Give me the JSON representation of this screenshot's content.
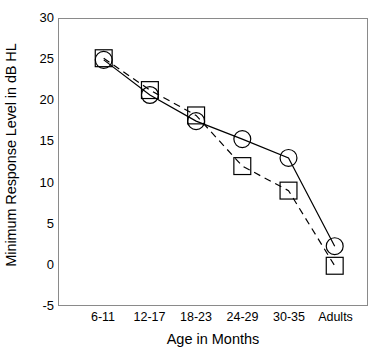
{
  "chart_data": {
    "type": "line",
    "title": "",
    "xlabel": "Age in Months",
    "ylabel": "Minimum Response Level in dB HL",
    "categories": [
      "6-11",
      "12-17",
      "18-23",
      "24-29",
      "30-35",
      "Adults"
    ],
    "yticks": [
      30,
      25,
      20,
      15,
      10,
      5,
      0,
      -5
    ],
    "ytick_labels": [
      "30",
      "25",
      "20",
      "15",
      "10",
      "5",
      "0",
      "-5"
    ],
    "ylim": [
      -5,
      30
    ],
    "grid": false,
    "legend": "none",
    "series": [
      {
        "name": "circle-series",
        "marker": "circle",
        "linestyle": "solid",
        "color": "#000000",
        "values": [
          25.0,
          20.7,
          17.5,
          15.3,
          13.0,
          2.2
        ]
      },
      {
        "name": "square-series",
        "marker": "square",
        "linestyle": "dashed",
        "color": "#000000",
        "values": [
          25.2,
          21.3,
          18.2,
          12.0,
          9.0,
          -0.2
        ]
      }
    ]
  },
  "axes": {
    "frame_color": "#8a8a8a",
    "background": "#ffffff"
  }
}
